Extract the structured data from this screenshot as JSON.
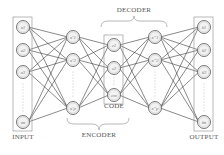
{
  "diagram": {
    "colors": {
      "edge": "#3a3a3a",
      "node_stroke": "#666666",
      "node_fill": "#f2f2f2",
      "box_stroke": "#9a9a9a",
      "dots": "#888888",
      "label": "#555555"
    },
    "labels": {
      "input": "INPUT",
      "encoder": "ENCODER",
      "code": "CODE",
      "decoder": "DECODER",
      "output": "OUTPUT"
    },
    "layers": [
      {
        "name": "input",
        "boxed": true,
        "x": 23,
        "nodes": [
          {
            "label": "x1",
            "y": 27
          },
          {
            "label": "x2",
            "y": 50
          },
          {
            "label": "x3",
            "y": 72
          },
          {
            "label": "xn",
            "y": 122
          }
        ],
        "dots_between": [
          84,
          112
        ]
      },
      {
        "name": "encoder-hidden",
        "boxed": false,
        "x": 73,
        "nodes": [
          {
            "label": "x'1",
            "y": 37
          },
          {
            "label": "x'2",
            "y": 60
          },
          {
            "label": "x'p",
            "y": 108
          }
        ],
        "dots_between": [
          72,
          98
        ]
      },
      {
        "name": "code",
        "boxed": true,
        "x": 114,
        "nodes": [
          {
            "label": "c1",
            "y": 45
          },
          {
            "label": "c2",
            "y": 68
          },
          {
            "label": "cm",
            "y": 95
          }
        ],
        "dots_between": [
          78,
          86
        ]
      },
      {
        "name": "decoder-hidden",
        "boxed": false,
        "x": 155,
        "nodes": [
          {
            "label": "x''1",
            "y": 37
          },
          {
            "label": "x''2",
            "y": 60
          },
          {
            "label": "x''p",
            "y": 108
          }
        ],
        "dots_between": [
          72,
          98
        ]
      },
      {
        "name": "output",
        "boxed": true,
        "x": 204,
        "nodes": [
          {
            "label": "x̂1",
            "y": 27
          },
          {
            "label": "x̂2",
            "y": 50
          },
          {
            "label": "x̂3",
            "y": 72
          },
          {
            "label": "x̂n",
            "y": 122
          }
        ],
        "dots_between": [
          84,
          112
        ]
      }
    ]
  }
}
